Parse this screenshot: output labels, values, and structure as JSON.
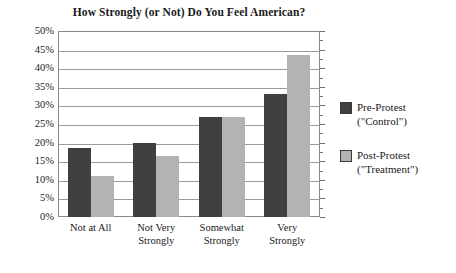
{
  "chart_data": {
    "type": "bar",
    "title": "How Strongly (or Not) Do You Feel American?",
    "xlabel": "",
    "ylabel": "",
    "categories": [
      "Not at All",
      "Not Very Strongly",
      "Somewhat Strongly",
      "Very Strongly"
    ],
    "category_lines": [
      [
        "Not at All"
      ],
      [
        "Not Very",
        "Strongly"
      ],
      [
        "Somewhat",
        "Strongly"
      ],
      [
        "Very",
        "Strongly"
      ]
    ],
    "series": [
      {
        "name": "Pre-Protest (\"Control\")",
        "name_lines": [
          "Pre-Protest",
          "(\"Control\")"
        ],
        "color": "#404040",
        "values": [
          18.5,
          20,
          27,
          33
        ]
      },
      {
        "name": "Post-Protest (\"Treatment\")",
        "name_lines": [
          "Post-Protest",
          "(\"Treatment\")"
        ],
        "color": "#b3b3b3",
        "values": [
          11,
          16.5,
          27,
          43.5
        ]
      }
    ],
    "ylim": [
      0,
      50
    ],
    "ytick_values": [
      0,
      5,
      10,
      15,
      20,
      25,
      30,
      35,
      40,
      45,
      50
    ],
    "ytick_labels": [
      "0%",
      "5%",
      "10%",
      "15%",
      "20%",
      "25%",
      "30%",
      "35%",
      "40%",
      "45%",
      "50%"
    ],
    "grid": true,
    "legend_position": "right"
  }
}
